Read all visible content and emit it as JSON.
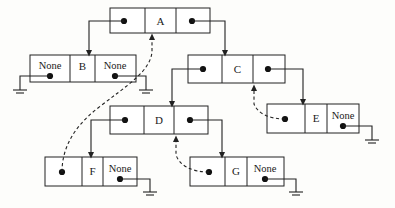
{
  "diagram": {
    "type": "node-pointer-diagram",
    "canvas": {
      "width": 395,
      "height": 208
    },
    "colors": {
      "background": "#fdfdfb",
      "stroke": "#222222",
      "text": "#1a1a1a",
      "dot": "#111111"
    },
    "none_text": "None",
    "nodes": [
      {
        "id": "A",
        "label": "A",
        "x": 110,
        "y": 8,
        "w": 100,
        "h": 25,
        "cells": [
          {
            "role": "left-pointer",
            "kind": "pointer",
            "text": ""
          },
          {
            "role": "data",
            "kind": "data",
            "text": "A"
          },
          {
            "role": "right-pointer",
            "kind": "pointer",
            "text": ""
          }
        ]
      },
      {
        "id": "B",
        "label": "B",
        "x": 30,
        "y": 55,
        "w": 106,
        "h": 27,
        "cells": [
          {
            "role": "left-pointer",
            "kind": "none",
            "text": "None"
          },
          {
            "role": "data",
            "kind": "data",
            "text": "B"
          },
          {
            "role": "right-pointer",
            "kind": "none",
            "text": "None"
          }
        ]
      },
      {
        "id": "C",
        "label": "C",
        "x": 188,
        "y": 55,
        "w": 97,
        "h": 28,
        "cells": [
          {
            "role": "left-pointer",
            "kind": "pointer",
            "text": ""
          },
          {
            "role": "data",
            "kind": "data",
            "text": "C"
          },
          {
            "role": "right-pointer",
            "kind": "pointer",
            "text": ""
          }
        ]
      },
      {
        "id": "D",
        "label": "D",
        "x": 110,
        "y": 106,
        "w": 98,
        "h": 28,
        "cells": [
          {
            "role": "left-pointer",
            "kind": "pointer",
            "text": ""
          },
          {
            "role": "data",
            "kind": "data",
            "text": "D"
          },
          {
            "role": "right-pointer",
            "kind": "pointer",
            "text": ""
          }
        ]
      },
      {
        "id": "E",
        "label": "E",
        "x": 267,
        "y": 104,
        "w": 92,
        "h": 29,
        "cells": [
          {
            "role": "left-pointer",
            "kind": "pointer",
            "text": ""
          },
          {
            "role": "data",
            "kind": "data",
            "text": "E"
          },
          {
            "role": "right-pointer",
            "kind": "none",
            "text": "None"
          }
        ]
      },
      {
        "id": "F",
        "label": "F",
        "x": 45,
        "y": 157,
        "w": 92,
        "h": 29,
        "cells": [
          {
            "role": "left-pointer",
            "kind": "pointer",
            "text": ""
          },
          {
            "role": "data",
            "kind": "data",
            "text": "F"
          },
          {
            "role": "right-pointer",
            "kind": "none",
            "text": "None"
          }
        ]
      },
      {
        "id": "G",
        "label": "G",
        "x": 190,
        "y": 157,
        "w": 94,
        "h": 29,
        "cells": [
          {
            "role": "left-pointer",
            "kind": "pointer",
            "text": ""
          },
          {
            "role": "data",
            "kind": "data",
            "text": "G"
          },
          {
            "role": "right-pointer",
            "kind": "none",
            "text": "None"
          }
        ]
      }
    ],
    "links": [
      {
        "from": "A",
        "from_cell": "left-pointer",
        "to": "B",
        "style": "solid",
        "arrow": true
      },
      {
        "from": "A",
        "from_cell": "right-pointer",
        "to": "C",
        "style": "solid",
        "arrow": true
      },
      {
        "from": "C",
        "from_cell": "left-pointer",
        "to": "D",
        "style": "solid",
        "arrow": true
      },
      {
        "from": "C",
        "from_cell": "right-pointer",
        "to": "E",
        "style": "solid",
        "arrow": true
      },
      {
        "from": "D",
        "from_cell": "left-pointer",
        "to": "F",
        "style": "solid",
        "arrow": true
      },
      {
        "from": "D",
        "from_cell": "right-pointer",
        "to": "G",
        "style": "solid",
        "arrow": true
      },
      {
        "from": "F",
        "from_cell": "left-pointer",
        "to": "A",
        "style": "dashed",
        "arrow": true
      },
      {
        "from": "E",
        "from_cell": "left-pointer",
        "to": "C",
        "style": "dashed",
        "arrow": true
      },
      {
        "from": "G",
        "from_cell": "left-pointer",
        "to": "D",
        "style": "dashed",
        "arrow": true
      }
    ],
    "grounds": [
      {
        "for": "B",
        "cell": "left-pointer"
      },
      {
        "for": "B",
        "cell": "right-pointer"
      },
      {
        "for": "E",
        "cell": "right-pointer"
      },
      {
        "for": "F",
        "cell": "right-pointer"
      },
      {
        "for": "G",
        "cell": "right-pointer"
      }
    ]
  }
}
